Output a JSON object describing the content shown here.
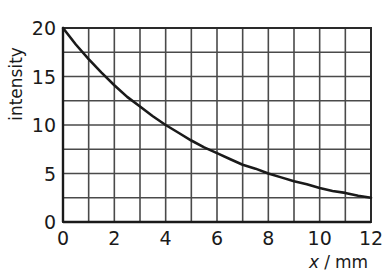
{
  "chart_data": {
    "type": "line",
    "title": "",
    "xlabel": "x / mm",
    "ylabel": "intensity",
    "xlim": [
      0,
      12
    ],
    "ylim": [
      0,
      20
    ],
    "grid": true,
    "grid_x_step": 1,
    "grid_y_step": 2.5,
    "legend": "none",
    "xticks": [
      "0",
      "2",
      "4",
      "6",
      "8",
      "10",
      "12"
    ],
    "xtick_values": [
      0,
      2,
      4,
      6,
      8,
      10,
      12
    ],
    "yticks": [
      "0",
      "5",
      "10",
      "15",
      "20"
    ],
    "ytick_values": [
      0,
      5,
      10,
      15,
      20
    ],
    "series": [
      {
        "name": "intensity",
        "x": [
          0,
          0.5,
          1,
          1.5,
          2,
          2.5,
          3,
          3.5,
          4,
          4.5,
          5,
          5.5,
          6,
          6.5,
          7,
          7.5,
          8,
          8.5,
          9,
          9.5,
          10,
          10.5,
          11,
          11.5,
          12
        ],
        "values": [
          20.0,
          18.3,
          16.8,
          15.4,
          14.1,
          12.9,
          11.9,
          10.9,
          10.0,
          9.2,
          8.4,
          7.7,
          7.1,
          6.5,
          5.9,
          5.5,
          5.0,
          4.6,
          4.2,
          3.9,
          3.5,
          3.2,
          3.0,
          2.7,
          2.5
        ]
      }
    ]
  },
  "axes": {
    "y_label": "intensity",
    "x_label_variable": "x",
    "x_label_separator": "/",
    "x_label_unit": "mm"
  },
  "colors": {
    "curve": "#1a1a1a",
    "grid": "#4a4a4a",
    "axis": "#1a1a1a",
    "text": "#1a1a1a",
    "background": "#ffffff"
  }
}
